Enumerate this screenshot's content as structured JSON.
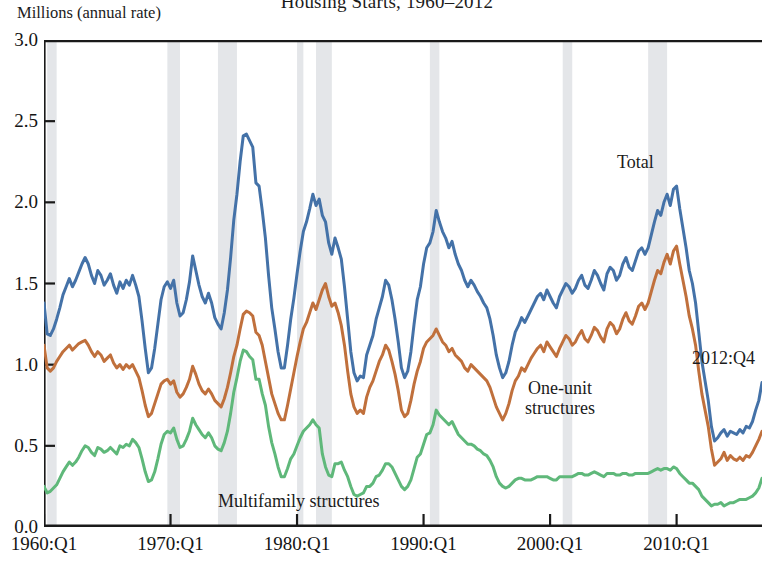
{
  "chart_title": "Housing Starts, 1960–2012",
  "y_axis_title": "Millions (annual rate)",
  "annotations": {
    "total": "Total",
    "one_unit_line1": "One-unit",
    "one_unit_line2": "structures",
    "multifamily": "Multifamily structures",
    "endpoint": "2012:Q4"
  },
  "colors": {
    "total": "#4472A8",
    "one_unit": "#C0703C",
    "multifamily": "#5FB87A",
    "recession_band": "#d4d7dc",
    "axis": "#1a1a1a"
  },
  "chart_data": {
    "type": "line",
    "title": "Housing Starts, 1960–2012",
    "subtitle": "",
    "xlabel": "",
    "ylabel": "Millions (annual rate)",
    "ylim": [
      0.0,
      3.0
    ],
    "yticks": [
      0.0,
      0.5,
      1.0,
      1.5,
      2.0,
      2.5,
      3.0
    ],
    "ytick_labels": [
      "0.0",
      "0.5",
      "1.0",
      "1.5",
      "2.0",
      "2.5",
      "3.0"
    ],
    "xlim": [
      "1960:Q1",
      "2012:Q4"
    ],
    "xticks": [
      1960,
      1970,
      1980,
      1990,
      2000,
      2010
    ],
    "xtick_labels": [
      "1960:Q1",
      "1970:Q1",
      "1980:Q1",
      "1990:Q1",
      "2000:Q1",
      "2010:Q1"
    ],
    "grid": false,
    "legend_position": "inline-annotations",
    "x_start_year": 1960.0,
    "x_step_years": 0.25,
    "recession_bands": [
      [
        1960.25,
        1961.0
      ],
      [
        1969.75,
        1970.75
      ],
      [
        1973.75,
        1975.25
      ],
      [
        1980.0,
        1980.5
      ],
      [
        1981.5,
        1982.75
      ],
      [
        1990.5,
        1991.25
      ],
      [
        2001.0,
        2001.75
      ],
      [
        2007.75,
        2009.25
      ]
    ],
    "series": [
      {
        "name": "Total",
        "color": "#4472A8",
        "values": [
          1.38,
          1.19,
          1.18,
          1.22,
          1.28,
          1.35,
          1.43,
          1.48,
          1.53,
          1.48,
          1.52,
          1.57,
          1.62,
          1.66,
          1.62,
          1.55,
          1.5,
          1.58,
          1.55,
          1.49,
          1.52,
          1.56,
          1.49,
          1.44,
          1.51,
          1.47,
          1.52,
          1.49,
          1.55,
          1.49,
          1.42,
          1.27,
          1.1,
          0.95,
          0.98,
          1.1,
          1.25,
          1.4,
          1.48,
          1.51,
          1.47,
          1.52,
          1.38,
          1.3,
          1.32,
          1.4,
          1.51,
          1.67,
          1.58,
          1.49,
          1.42,
          1.38,
          1.44,
          1.38,
          1.29,
          1.25,
          1.22,
          1.32,
          1.46,
          1.66,
          1.89,
          2.05,
          2.25,
          2.41,
          2.42,
          2.38,
          2.34,
          2.12,
          2.1,
          1.95,
          1.78,
          1.55,
          1.35,
          1.22,
          1.08,
          0.98,
          0.98,
          1.12,
          1.28,
          1.41,
          1.56,
          1.7,
          1.82,
          1.88,
          1.96,
          2.05,
          1.98,
          2.02,
          1.92,
          1.88,
          1.75,
          1.68,
          1.78,
          1.72,
          1.65,
          1.48,
          1.28,
          1.08,
          0.95,
          0.9,
          0.93,
          0.92,
          1.06,
          1.12,
          1.18,
          1.28,
          1.35,
          1.42,
          1.52,
          1.49,
          1.4,
          1.28,
          1.14,
          0.98,
          0.92,
          0.96,
          1.08,
          1.25,
          1.4,
          1.48,
          1.62,
          1.72,
          1.75,
          1.82,
          1.95,
          1.88,
          1.82,
          1.78,
          1.72,
          1.76,
          1.68,
          1.62,
          1.58,
          1.52,
          1.48,
          1.52,
          1.49,
          1.45,
          1.42,
          1.38,
          1.35,
          1.28,
          1.18,
          1.06,
          0.98,
          0.92,
          0.95,
          1.02,
          1.12,
          1.2,
          1.24,
          1.29,
          1.26,
          1.3,
          1.34,
          1.38,
          1.42,
          1.44,
          1.4,
          1.46,
          1.42,
          1.38,
          1.35,
          1.42,
          1.46,
          1.5,
          1.48,
          1.44,
          1.47,
          1.52,
          1.55,
          1.49,
          1.47,
          1.52,
          1.58,
          1.55,
          1.5,
          1.46,
          1.56,
          1.6,
          1.58,
          1.52,
          1.55,
          1.62,
          1.66,
          1.6,
          1.58,
          1.64,
          1.7,
          1.72,
          1.68,
          1.72,
          1.8,
          1.88,
          1.95,
          1.92,
          2.0,
          2.05,
          1.98,
          2.08,
          2.1,
          1.96,
          1.84,
          1.72,
          1.58,
          1.5,
          1.38,
          1.2,
          1.02,
          0.9,
          0.78,
          0.62,
          0.53,
          0.55,
          0.58,
          0.6,
          0.56,
          0.59,
          0.58,
          0.57,
          0.6,
          0.58,
          0.62,
          0.61,
          0.65,
          0.72,
          0.78,
          0.89
        ]
      },
      {
        "name": "One-unit structures",
        "color": "#C0703C",
        "values": [
          1.12,
          0.98,
          0.96,
          0.98,
          1.02,
          1.05,
          1.08,
          1.1,
          1.12,
          1.09,
          1.11,
          1.13,
          1.14,
          1.15,
          1.12,
          1.08,
          1.05,
          1.08,
          1.06,
          1.02,
          1.04,
          1.06,
          1.01,
          0.98,
          1.0,
          0.97,
          1.0,
          0.98,
          1.0,
          0.96,
          0.92,
          0.84,
          0.75,
          0.68,
          0.7,
          0.76,
          0.82,
          0.88,
          0.9,
          0.91,
          0.88,
          0.9,
          0.83,
          0.8,
          0.82,
          0.86,
          0.91,
          0.99,
          0.94,
          0.88,
          0.84,
          0.82,
          0.85,
          0.82,
          0.78,
          0.76,
          0.74,
          0.79,
          0.86,
          0.95,
          1.05,
          1.12,
          1.22,
          1.31,
          1.33,
          1.32,
          1.3,
          1.2,
          1.18,
          1.12,
          1.02,
          0.92,
          0.82,
          0.76,
          0.7,
          0.66,
          0.66,
          0.75,
          0.85,
          0.95,
          1.05,
          1.14,
          1.22,
          1.26,
          1.32,
          1.38,
          1.34,
          1.4,
          1.46,
          1.5,
          1.42,
          1.36,
          1.38,
          1.32,
          1.24,
          1.12,
          0.96,
          0.82,
          0.74,
          0.7,
          0.72,
          0.7,
          0.8,
          0.86,
          0.9,
          0.96,
          1.02,
          1.06,
          1.12,
          1.09,
          1.02,
          0.94,
          0.84,
          0.72,
          0.68,
          0.7,
          0.78,
          0.88,
          0.96,
          1.02,
          1.1,
          1.14,
          1.16,
          1.18,
          1.22,
          1.18,
          1.14,
          1.12,
          1.08,
          1.1,
          1.06,
          1.04,
          1.02,
          0.98,
          0.96,
          1.0,
          0.98,
          0.96,
          0.94,
          0.92,
          0.9,
          0.86,
          0.8,
          0.74,
          0.7,
          0.66,
          0.7,
          0.76,
          0.84,
          0.9,
          0.93,
          0.98,
          0.96,
          1.0,
          1.04,
          1.07,
          1.1,
          1.12,
          1.08,
          1.14,
          1.11,
          1.08,
          1.05,
          1.1,
          1.14,
          1.18,
          1.16,
          1.12,
          1.14,
          1.18,
          1.21,
          1.16,
          1.14,
          1.18,
          1.23,
          1.21,
          1.17,
          1.14,
          1.22,
          1.26,
          1.24,
          1.19,
          1.22,
          1.28,
          1.32,
          1.27,
          1.25,
          1.3,
          1.36,
          1.38,
          1.34,
          1.38,
          1.45,
          1.52,
          1.58,
          1.56,
          1.63,
          1.68,
          1.62,
          1.7,
          1.73,
          1.62,
          1.52,
          1.42,
          1.3,
          1.22,
          1.12,
          0.96,
          0.82,
          0.72,
          0.62,
          0.48,
          0.38,
          0.4,
          0.42,
          0.46,
          0.41,
          0.44,
          0.42,
          0.41,
          0.43,
          0.41,
          0.44,
          0.43,
          0.46,
          0.5,
          0.54,
          0.59
        ]
      },
      {
        "name": "Multifamily structures",
        "color": "#5FB87A",
        "values": [
          0.25,
          0.21,
          0.22,
          0.24,
          0.26,
          0.3,
          0.34,
          0.37,
          0.4,
          0.38,
          0.4,
          0.43,
          0.47,
          0.5,
          0.49,
          0.46,
          0.44,
          0.49,
          0.48,
          0.46,
          0.47,
          0.49,
          0.47,
          0.45,
          0.5,
          0.49,
          0.51,
          0.5,
          0.54,
          0.52,
          0.49,
          0.42,
          0.34,
          0.28,
          0.29,
          0.34,
          0.42,
          0.51,
          0.57,
          0.59,
          0.58,
          0.61,
          0.54,
          0.49,
          0.5,
          0.54,
          0.59,
          0.67,
          0.63,
          0.6,
          0.57,
          0.55,
          0.58,
          0.55,
          0.5,
          0.48,
          0.47,
          0.52,
          0.59,
          0.7,
          0.83,
          0.92,
          1.02,
          1.09,
          1.08,
          1.05,
          1.03,
          0.91,
          0.91,
          0.82,
          0.75,
          0.62,
          0.52,
          0.45,
          0.37,
          0.31,
          0.31,
          0.36,
          0.42,
          0.45,
          0.5,
          0.55,
          0.59,
          0.61,
          0.63,
          0.66,
          0.63,
          0.61,
          0.45,
          0.37,
          0.32,
          0.31,
          0.39,
          0.39,
          0.4,
          0.35,
          0.31,
          0.25,
          0.2,
          0.19,
          0.2,
          0.21,
          0.25,
          0.25,
          0.27,
          0.31,
          0.32,
          0.35,
          0.39,
          0.39,
          0.37,
          0.33,
          0.29,
          0.25,
          0.23,
          0.25,
          0.29,
          0.36,
          0.43,
          0.45,
          0.51,
          0.57,
          0.58,
          0.63,
          0.72,
          0.69,
          0.67,
          0.65,
          0.63,
          0.65,
          0.61,
          0.57,
          0.55,
          0.53,
          0.51,
          0.51,
          0.5,
          0.48,
          0.47,
          0.45,
          0.44,
          0.41,
          0.37,
          0.31,
          0.27,
          0.25,
          0.24,
          0.25,
          0.27,
          0.29,
          0.3,
          0.3,
          0.29,
          0.29,
          0.29,
          0.3,
          0.31,
          0.31,
          0.31,
          0.31,
          0.3,
          0.29,
          0.29,
          0.31,
          0.31,
          0.31,
          0.31,
          0.31,
          0.32,
          0.33,
          0.33,
          0.32,
          0.32,
          0.33,
          0.34,
          0.33,
          0.32,
          0.31,
          0.33,
          0.33,
          0.33,
          0.32,
          0.32,
          0.33,
          0.33,
          0.32,
          0.32,
          0.33,
          0.33,
          0.33,
          0.33,
          0.33,
          0.34,
          0.35,
          0.36,
          0.35,
          0.36,
          0.36,
          0.35,
          0.37,
          0.36,
          0.33,
          0.31,
          0.29,
          0.27,
          0.27,
          0.25,
          0.23,
          0.19,
          0.17,
          0.15,
          0.13,
          0.14,
          0.14,
          0.15,
          0.13,
          0.14,
          0.15,
          0.15,
          0.16,
          0.17,
          0.17,
          0.17,
          0.18,
          0.19,
          0.21,
          0.24,
          0.3
        ]
      }
    ]
  }
}
